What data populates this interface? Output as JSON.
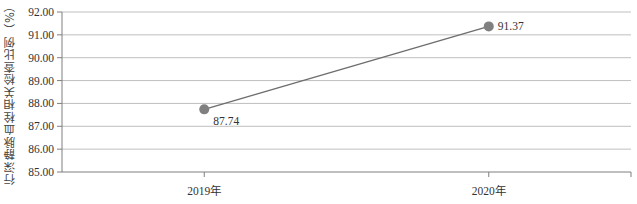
{
  "chart_data": {
    "type": "line",
    "title": "",
    "xlabel": "",
    "ylabel": "行深静脉血栓相关检查比例（%）",
    "categories": [
      "2019年",
      "2020年"
    ],
    "series": [
      {
        "name": "行深静脉血栓相关检查比例",
        "values": [
          87.74,
          91.37
        ],
        "color": "#808080"
      }
    ],
    "data_labels": [
      "87.74",
      "91.37"
    ],
    "ylim": [
      85.0,
      92.0
    ],
    "yticks": [
      "85.00",
      "86.00",
      "87.00",
      "88.00",
      "89.00",
      "90.00",
      "91.00",
      "92.00"
    ],
    "grid": true,
    "legend": null
  },
  "colors": {
    "line": "#6e6e6e",
    "marker": "#808080",
    "grid": "#bfbfbf",
    "axis": "#7f7f7f"
  }
}
